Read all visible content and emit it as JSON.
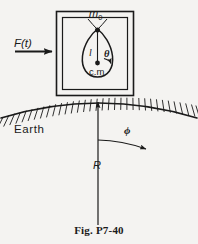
{
  "figure": {
    "caption": "Fig.  P7-40",
    "background_color": "#f4f3f1",
    "ink_color": "#1a1a1a",
    "labels": {
      "pivot_mass": "m",
      "pivot_mass_subscript": "0",
      "applied_force": "F(t)",
      "pendulum_length": "l",
      "pendulum_angle": "θ",
      "center_of_mass": "c.m",
      "ground": "Earth",
      "earth_angle": "ϕ",
      "earth_radius": "R"
    },
    "elements": {
      "outer_box": "cart-outer-rectangle",
      "inner_box": "cart-inner-rectangle",
      "bob": "pendulum-bob-teardrop",
      "pivot": "pendulum-pivot-point",
      "cm_point": "center-of-mass-point",
      "ground_arc": "earth-surface-arc",
      "hatching": "earth-surface-hatching",
      "radius_line": "earth-radius-line",
      "force_arrow": "applied-force-arrow",
      "theta_arrow": "theta-angle-arrow",
      "phi_arrow": "phi-angle-arrow"
    }
  }
}
